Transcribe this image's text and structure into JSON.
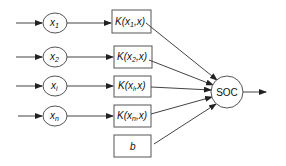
{
  "diagram": {
    "type": "svm-kernel-network",
    "inputs": [
      {
        "var": "x",
        "sub": "1"
      },
      {
        "var": "x",
        "sub": "2"
      },
      {
        "var": "x",
        "sub": "i"
      },
      {
        "var": "x",
        "sub": "n"
      }
    ],
    "kernels": [
      {
        "prefix": "K(x",
        "sub": "1",
        "suffix": ",x)"
      },
      {
        "prefix": "K(x",
        "sub": "2",
        "suffix": ",x)"
      },
      {
        "prefix": "K(x",
        "sub": "i",
        "suffix": ",x)"
      },
      {
        "prefix": "K(x",
        "sub": "n",
        "suffix": ",x)"
      }
    ],
    "bias": {
      "label": "b"
    },
    "output": {
      "label": "SOC"
    },
    "colors": {
      "stroke": "#555555",
      "text": "#111111",
      "background": "#ffffff"
    }
  }
}
